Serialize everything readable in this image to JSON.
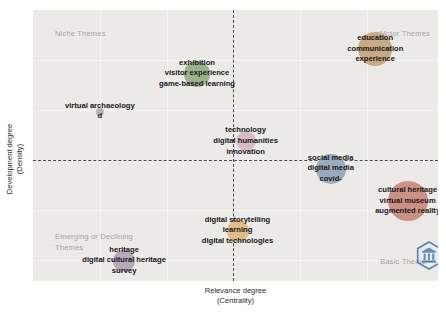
{
  "axes": {
    "x_title": "Relevance degree",
    "x_subtitle": "(Centrality)",
    "y_title": "Development degree",
    "y_subtitle": "(Density)"
  },
  "quadrants": {
    "top_left": "Niche Themes",
    "top_right": "Motor Themes",
    "bottom_left": "Emerging or Declining Themes",
    "bottom_right": "Basic Themes"
  },
  "icons": {
    "watermark": "hexagon-badge-icon"
  },
  "chart_data": {
    "type": "scatter",
    "title": "",
    "xlabel": "Relevance degree (Centrality)",
    "ylabel": "Development degree (Density)",
    "grid": true,
    "legend": "none",
    "quadrant_split": {
      "x": 0.5,
      "y": 0.5
    },
    "quadrant_names": {
      "top_left": "Niche Themes",
      "top_right": "Motor Themes",
      "bottom_left": "Emerging or Declining Themes",
      "bottom_right": "Basic Themes"
    },
    "xlim": [
      0,
      1
    ],
    "ylim": [
      0,
      1
    ],
    "points": [
      {
        "id": "exhibition-cluster",
        "labels": [
          "exhibition",
          "visitor experience",
          "game-based learning"
        ],
        "x": 0.405,
        "y": 0.765,
        "radius_px": 13,
        "color": "#9bb089",
        "quadrant": "Niche Themes"
      },
      {
        "id": "virtual-archaeology-cluster",
        "labels": [
          "virtual archaeology",
          "d"
        ],
        "x": 0.165,
        "y": 0.625,
        "radius_px": 4,
        "color": "#b9b2ad",
        "quadrant": "Niche Themes"
      },
      {
        "id": "technology-cluster",
        "labels": [
          "technology",
          "digital humanities",
          "innovation"
        ],
        "x": 0.525,
        "y": 0.515,
        "radius_px": 10,
        "color": "#d9bcc3",
        "quadrant": "Motor Themes"
      },
      {
        "id": "education-cluster",
        "labels": [
          "education",
          "communication",
          "experience"
        ],
        "x": 0.845,
        "y": 0.855,
        "radius_px": 17,
        "color": "#c7ab84",
        "quadrant": "Motor Themes"
      },
      {
        "id": "social-media-cluster",
        "labels": [
          "social media",
          "digital media",
          "covid-"
        ],
        "x": 0.735,
        "y": 0.415,
        "radius_px": 15,
        "color": "#9aabbe",
        "quadrant": "Basic Themes"
      },
      {
        "id": "cultural-heritage-cluster",
        "labels": [
          "cultural heritage",
          "virtual museum",
          "augmented reality"
        ],
        "x": 0.925,
        "y": 0.295,
        "radius_px": 20,
        "color": "#cc9183",
        "quadrant": "Basic Themes"
      },
      {
        "id": "digital-storytelling-cluster",
        "labels": [
          "digital storytelling",
          "learning",
          "digital technologies"
        ],
        "x": 0.505,
        "y": 0.185,
        "radius_px": 11,
        "color": "#e0bd86",
        "quadrant": "Basic Themes"
      },
      {
        "id": "heritage-cluster",
        "labels": [
          "heritage",
          "digital cultural heritage",
          "survey"
        ],
        "x": 0.225,
        "y": 0.075,
        "radius_px": 11,
        "color": "#b9a8bb",
        "quadrant": "Emerging or Declining Themes"
      }
    ]
  }
}
